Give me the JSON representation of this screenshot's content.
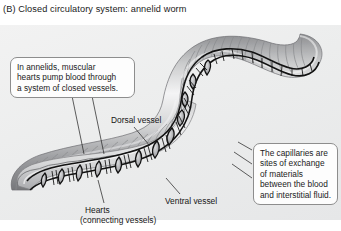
{
  "figure": {
    "panel_letter": "(B)",
    "title": "(B)  Closed circulatory system: annelid worm",
    "background_color": "#eceded",
    "title_color": "#1a1a1a"
  },
  "callouts": [
    {
      "id": "annelid-hearts",
      "line1": "In annelids, muscular",
      "line2": "hearts pump blood through",
      "line3": "a system of closed vessels."
    },
    {
      "id": "capillary-exchange",
      "line1": "The capillaries are",
      "line2": "sites of exchange",
      "line3": "of materials",
      "line4": "between the blood",
      "line5": "and interstitial fluid."
    }
  ],
  "labels": {
    "dorsal_vessel": "Dorsal vessel",
    "ventral_vessel": "Ventral vessel",
    "hearts": "Hearts",
    "hearts_sub": "(connecting vessels)"
  },
  "illustration": {
    "subject": "annelid-worm",
    "worm_body_color": "#b9babc",
    "worm_highlight_color": "#f1f1f2",
    "worm_shadow_color": "#79797c",
    "vessel_color": "#141414",
    "segment_count": 34,
    "heart_count": 9,
    "capillary_count": 26
  }
}
